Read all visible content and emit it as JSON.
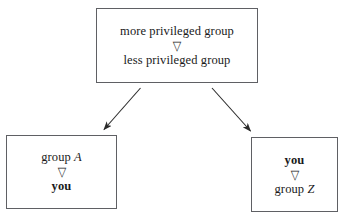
{
  "diagram": {
    "type": "flow-diagram",
    "background_color": "#ffffff",
    "border_color": "#5f6064",
    "text_color": "#1a1a1a",
    "relation_glyph": "▽",
    "relation_glyph_name": "down-pointing-triangle-icon",
    "nodes": [
      {
        "id": "top",
        "name": "privilege-hierarchy-box",
        "lines": [
          {
            "text": "more privileged group",
            "style": "regular"
          },
          {
            "text": "▽",
            "style": "glyph"
          },
          {
            "text": "less privileged group",
            "style": "regular"
          }
        ]
      },
      {
        "id": "bottom-left",
        "name": "group-a-box",
        "lines": [
          {
            "text_prefix": "group ",
            "text_italic": "A",
            "style": "regular-italic-tail"
          },
          {
            "text": "▽",
            "style": "glyph"
          },
          {
            "text": "you",
            "style": "bold"
          }
        ]
      },
      {
        "id": "bottom-right",
        "name": "group-z-box",
        "lines": [
          {
            "text": "you",
            "style": "bold"
          },
          {
            "text": "▽",
            "style": "glyph"
          },
          {
            "text_prefix": "group ",
            "text_italic": "Z",
            "style": "regular-italic-tail"
          }
        ]
      }
    ],
    "edges": [
      {
        "name": "arrow-top-to-group-a",
        "from": "top",
        "to": "bottom-left",
        "direction": "down-left"
      },
      {
        "name": "arrow-top-to-group-z",
        "from": "top",
        "to": "bottom-right",
        "direction": "down-right"
      }
    ],
    "labels": {
      "top_line_1": "more privileged group",
      "top_line_2": "less privileged group",
      "bottom_left_line_1_prefix": "group ",
      "bottom_left_line_1_italic": "A",
      "bottom_left_line_3": "you",
      "bottom_right_line_1": "you",
      "bottom_right_line_3_prefix": "group ",
      "bottom_right_line_3_italic": "Z",
      "glyph": "▽"
    }
  }
}
